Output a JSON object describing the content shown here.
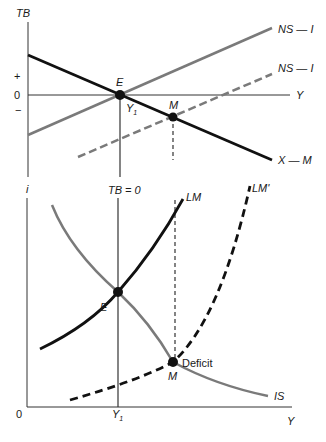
{
  "colors": {
    "black_curve": "#111111",
    "gray_curve": "#7a7a7a",
    "axis": "#333333",
    "background": "#ffffff"
  },
  "top_panel": {
    "y_axis_label": "TB",
    "x_axis_label": "Y",
    "tick_plus": "+",
    "tick_zero": "0",
    "tick_minus": "−",
    "curves": {
      "x_minus_m": "X — M",
      "ns_minus_i": "NS — I",
      "ns_minus_i_shifted": "NS — I"
    },
    "points": {
      "e": "E",
      "m": "M"
    },
    "y1_label": "Y",
    "y1_sub": "1"
  },
  "bottom_panel": {
    "y_axis_label": "i",
    "x_axis_label": "Y",
    "origin_label": "0",
    "tb_zero_label": "TB = 0",
    "curves": {
      "lm": "LM",
      "lm_prime": "LM'",
      "is": "IS"
    },
    "points": {
      "e": "E",
      "m": "M"
    },
    "deficit_label": "Deficit",
    "y1_label": "Y",
    "y1_sub": "1"
  }
}
